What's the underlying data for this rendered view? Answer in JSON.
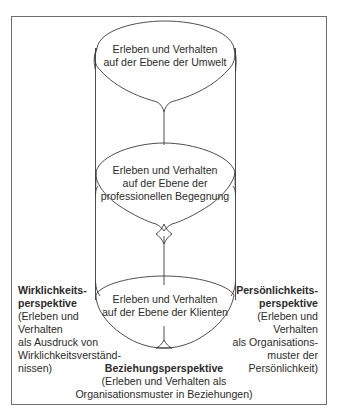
{
  "diagram": {
    "levels": [
      {
        "id": "umwelt",
        "lines": [
          "Erleben und Verhalten",
          "auf der Ebene der Umwelt"
        ]
      },
      {
        "id": "begegnung",
        "lines": [
          "Erleben und Verhalten",
          "auf der Ebene der",
          "professionellen Begegnung"
        ]
      },
      {
        "id": "klienten",
        "lines": [
          "Erleben und Verhalten",
          "auf der Ebene der Klienten"
        ]
      }
    ],
    "perspectives": {
      "left": {
        "title": [
          "Wirklichkeits-",
          "perspektive"
        ],
        "body": [
          "(Erleben und",
          "Verhalten",
          "als Ausdruck von",
          "Wirklichkeitsverständ-",
          "nissen)"
        ]
      },
      "right": {
        "title": [
          "Persönlichkeits-",
          "perspektive"
        ],
        "body": [
          "(Erleben und",
          "Verhalten",
          "als Organisations-",
          "muster der",
          "Persönlichkeit)"
        ]
      },
      "bottom": {
        "title": [
          "Beziehungsperspektive"
        ],
        "body": [
          "(Erleben und Verhalten als",
          "Organisationsmuster in Beziehungen)"
        ]
      }
    },
    "colors": {
      "stroke": "#3a3a3a",
      "frame": "#6e6e6e",
      "text": "#2b2b2b"
    }
  }
}
